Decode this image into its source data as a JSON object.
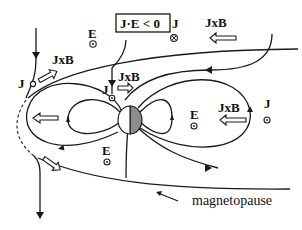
{
  "diagram": {
    "title_box": "J·E < 0",
    "labels": {
      "e_top": "E",
      "j_top_right": "J",
      "jxb_top_right": "JxB",
      "j_left": "J",
      "jxb_left": "JxB",
      "j_center": "J",
      "jxb_center": "JxB",
      "e_center_bottom": "E",
      "e_right": "E",
      "jxb_right": "JxB",
      "j_right": "J"
    },
    "caption": "magnetopause",
    "symbols": {
      "out_of_page": "dot-in-circle",
      "into_page": "cross-in-circle"
    },
    "colors": {
      "ink": "#1a1a1a",
      "earth_night": "#8c8c8c",
      "background": "#ffffff"
    }
  }
}
